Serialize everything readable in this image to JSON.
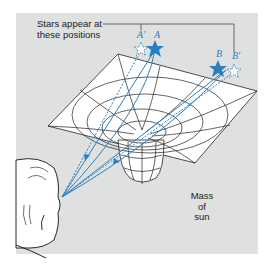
{
  "figure": {
    "caption_line1": "Stars appear at",
    "caption_line2": "these positions",
    "mass_label_line1": "Mass",
    "mass_label_line2": "of",
    "mass_label_line3": "sun",
    "stars": {
      "a_apparent": "A′",
      "a_actual": "A",
      "b_actual": "B",
      "b_apparent": "B′"
    },
    "colors": {
      "panel_bg": "#dfe1e1",
      "ray": "#2a7fc0",
      "star": "#2a7fc0",
      "grid_line": "#222222",
      "surface": "#ffffff"
    }
  }
}
